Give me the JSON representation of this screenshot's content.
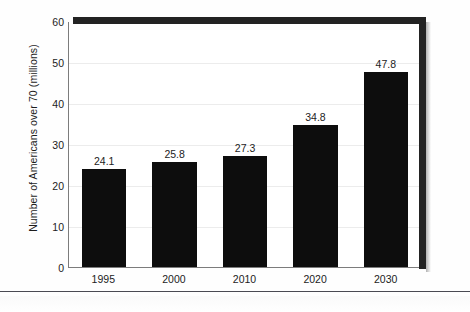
{
  "chart_data": {
    "type": "bar",
    "title": "",
    "xlabel": "",
    "ylabel": "Number of Americans over 70 (millions)",
    "categories": [
      "1995",
      "2000",
      "2010",
      "2020",
      "2030"
    ],
    "values": [
      24.1,
      25.8,
      27.3,
      34.8,
      47.8
    ],
    "value_labels": [
      "24.1",
      "25.8",
      "27.3",
      "34.8",
      "47.8"
    ],
    "ylim": [
      0,
      60
    ],
    "yticks": [
      0,
      10,
      20,
      30,
      40,
      50,
      60
    ],
    "ytick_labels": [
      "0",
      "10",
      "20",
      "30",
      "40",
      "50",
      "60"
    ],
    "grid": true,
    "legend": null,
    "bar_color": "#0d0d0d",
    "frame_color": "#232323",
    "gridline_color": "#ececec"
  },
  "figure": {
    "background_color": "#ffffff",
    "axis_color": "#7c7c7c",
    "bottom_rule_color": "#4a4a52"
  }
}
